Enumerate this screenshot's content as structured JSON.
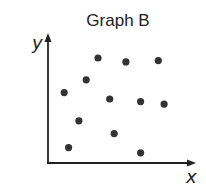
{
  "chart_data": {
    "type": "scatter",
    "title": "Graph B",
    "xlabel": "x",
    "ylabel": "y",
    "xlim": [
      0,
      10
    ],
    "ylim": [
      0,
      10
    ],
    "grid": false,
    "legend": null,
    "ticks": false,
    "point_color": "#333333",
    "series": [
      {
        "name": "points",
        "points": [
          {
            "x": 3.4,
            "y": 8.2
          },
          {
            "x": 5.3,
            "y": 7.9
          },
          {
            "x": 7.5,
            "y": 8.0
          },
          {
            "x": 2.6,
            "y": 6.5
          },
          {
            "x": 1.1,
            "y": 5.5
          },
          {
            "x": 4.2,
            "y": 5.0
          },
          {
            "x": 6.3,
            "y": 4.8
          },
          {
            "x": 7.9,
            "y": 4.6
          },
          {
            "x": 2.1,
            "y": 3.3
          },
          {
            "x": 4.5,
            "y": 2.3
          },
          {
            "x": 1.4,
            "y": 1.2
          },
          {
            "x": 6.3,
            "y": 0.8
          }
        ]
      }
    ]
  }
}
